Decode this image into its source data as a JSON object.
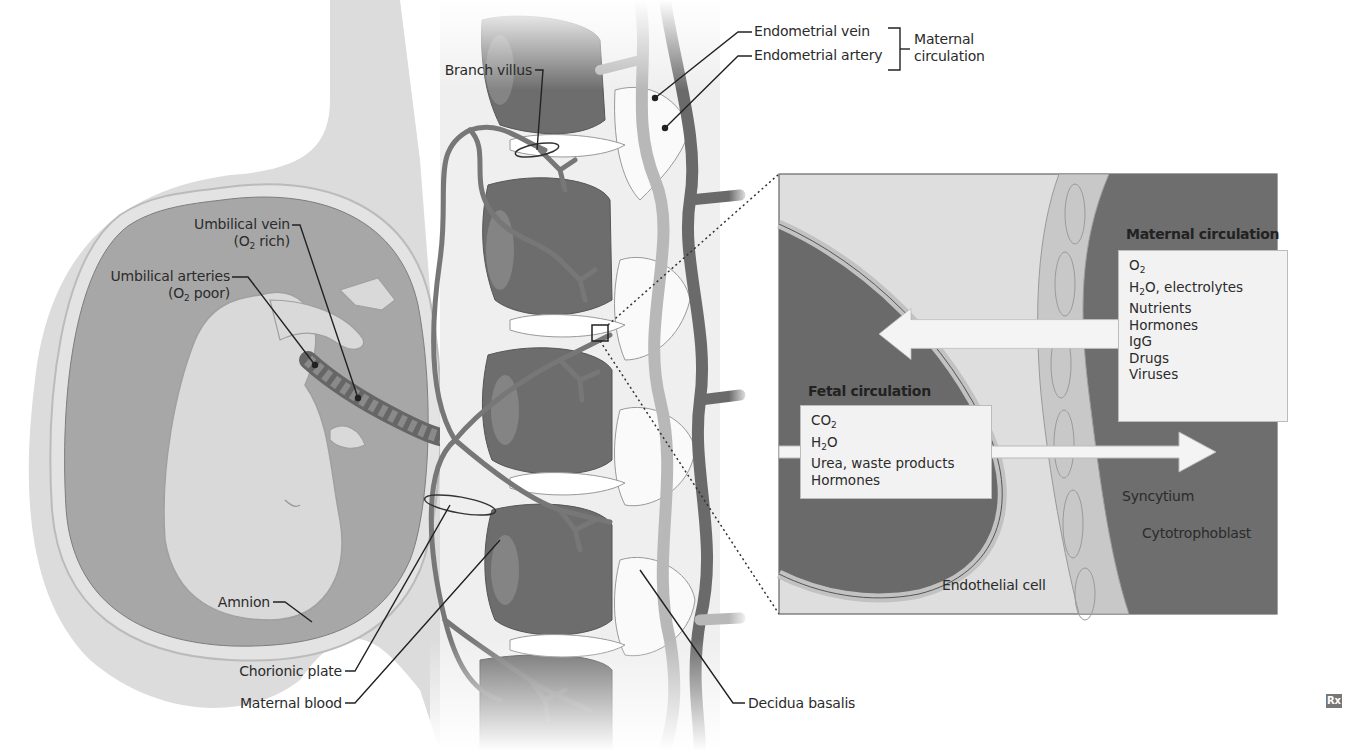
{
  "figure": {
    "type": "anatomical diagram"
  },
  "labels": {
    "endometrial_vein": "Endometrial vein",
    "endometrial_artery": "Endometrial artery",
    "maternal_circulation_bracket_line1": "Maternal",
    "maternal_circulation_bracket_line2": "circulation",
    "branch_villus": "Branch villus",
    "umbilical_vein": "Umbilical vein",
    "umbilical_vein_note_prefix": "(O",
    "umbilical_vein_note_sub": "2",
    "umbilical_vein_note_suffix": " rich)",
    "umbilical_arteries": "Umbilical arteries",
    "umbilical_arteries_note_prefix": "(O",
    "umbilical_arteries_note_sub": "2",
    "umbilical_arteries_note_suffix": " poor)",
    "amnion": "Amnion",
    "chorionic_plate": "Chorionic plate",
    "maternal_blood": "Maternal blood",
    "decidua_basalis": "Decidua basalis",
    "syncytium": "Syncytium",
    "cytotrophoblast": "Cytotrophoblast",
    "endothelial_cell": "Endothelial cell"
  },
  "inset": {
    "maternal": {
      "title": "Maternal circulation",
      "items": [
        {
          "base": "O",
          "sub": "2",
          "rest": ""
        },
        {
          "base": "H",
          "sub": "2",
          "rest": "O, electrolytes"
        },
        {
          "base": "Nutrients",
          "sub": "",
          "rest": ""
        },
        {
          "base": "Hormones",
          "sub": "",
          "rest": ""
        },
        {
          "base": "IgG",
          "sub": "",
          "rest": ""
        },
        {
          "base": "Drugs",
          "sub": "",
          "rest": ""
        },
        {
          "base": "Viruses",
          "sub": "",
          "rest": ""
        }
      ]
    },
    "fetal": {
      "title": "Fetal circulation",
      "items": [
        {
          "base": "CO",
          "sub": "2",
          "rest": ""
        },
        {
          "base": "H",
          "sub": "2",
          "rest": "O"
        },
        {
          "base": "Urea, waste products",
          "sub": "",
          "rest": ""
        },
        {
          "base": "Hormones",
          "sub": "",
          "rest": ""
        }
      ]
    }
  },
  "badge": {
    "text": "Rx"
  },
  "colors": {
    "fetal_blood_dark": "#6a6a6a",
    "maternal_blood_dark": "#6d6d6d",
    "amniotic_fluid": "#a9a9a9",
    "membrane_light": "#d6d6d6",
    "fetus": "#d9d9d9",
    "inset_background": "#dedede",
    "vessel": "#7a7a7a",
    "light_vessel": "#b8b8b8"
  }
}
